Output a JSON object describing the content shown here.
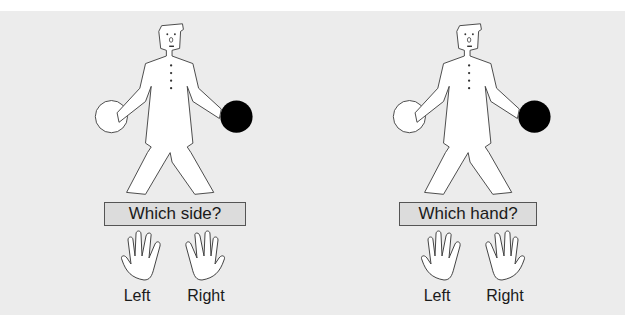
{
  "panels": [
    {
      "question": "Which side?",
      "hands": [
        {
          "label": "Left",
          "icon": "left-hand-icon"
        },
        {
          "label": "Right",
          "icon": "right-hand-icon"
        }
      ],
      "figure": {
        "left_ball": "white",
        "right_ball": "black"
      }
    },
    {
      "question": "Which hand?",
      "hands": [
        {
          "label": "Left",
          "icon": "left-hand-icon"
        },
        {
          "label": "Right",
          "icon": "right-hand-icon"
        }
      ],
      "figure": {
        "left_ball": "white",
        "right_ball": "black"
      }
    }
  ],
  "colors": {
    "background": "#ececec",
    "ball_dark": "#000000",
    "ball_light": "#ffffff",
    "box": "#dcdcdc"
  }
}
